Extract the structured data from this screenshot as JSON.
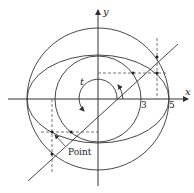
{
  "diagram": {
    "title": "",
    "axes": {
      "x_label": "x",
      "y_label": "y"
    },
    "tick_labels": [
      "3",
      "5"
    ],
    "angle_label": "t",
    "point_label": "Point",
    "shapes": {
      "outer_circle": {
        "radius_units": 5
      },
      "inner_circle": {
        "radius_units": 3
      },
      "ellipse": {
        "semi_major_units": 5,
        "semi_minor_units": 3
      },
      "angle_line": {
        "angle_degrees": 35
      }
    },
    "colors": {
      "stroke": "#333333",
      "dashed": "#555555",
      "background": "#ffffff"
    }
  }
}
